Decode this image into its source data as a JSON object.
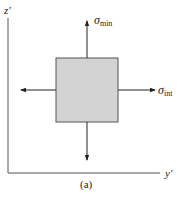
{
  "diagram": {
    "axes": {
      "vertical_label": "z′",
      "horizontal_label": "y′"
    },
    "element": {
      "fill": "#d3d3d3",
      "stroke": "#555555"
    },
    "stresses": {
      "vertical": {
        "symbol": "σ",
        "subscript": "min"
      },
      "horizontal": {
        "symbol": "σ",
        "subscript": "int"
      }
    },
    "caption": "(a)"
  }
}
